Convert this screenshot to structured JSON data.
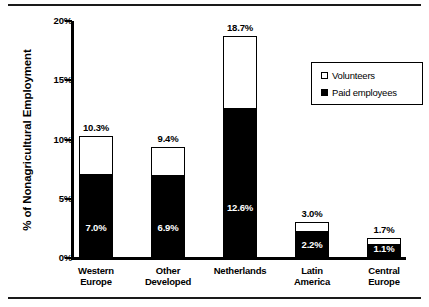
{
  "chart_data": {
    "type": "bar",
    "subtype": "stacked-bar",
    "title": "",
    "xlabel": "",
    "ylabel": "% of Nonagricultural Employment",
    "ylim": [
      0,
      20
    ],
    "yticks": [
      "0%",
      "5%",
      "10%",
      "15%",
      "20%"
    ],
    "ytick_values": [
      0,
      5,
      10,
      15,
      20
    ],
    "grid": false,
    "legend_position": "top-right",
    "categories": [
      "Western Europe",
      "Other Developed",
      "Netherlands",
      "Latin America",
      "Central Europe"
    ],
    "category_lines": [
      [
        "Western",
        "Europe"
      ],
      [
        "Other",
        "Developed"
      ],
      [
        "Netherlands",
        ""
      ],
      [
        "Latin",
        "America"
      ],
      [
        "Central",
        "Europe"
      ]
    ],
    "series": [
      {
        "name": "Paid employees",
        "color": "#000000",
        "values": [
          7.0,
          6.9,
          12.6,
          2.2,
          1.1
        ],
        "labels": [
          "7.0%",
          "6.9%",
          "12.6%",
          "2.2%",
          "1.1%"
        ]
      },
      {
        "name": "Volunteers",
        "color": "#ffffff",
        "values": [
          3.3,
          2.5,
          6.1,
          0.8,
          0.6
        ],
        "labels": [
          "",
          "",
          "",
          "",
          ""
        ]
      }
    ],
    "totals": [
      10.3,
      9.4,
      18.7,
      3.0,
      1.7
    ],
    "total_labels": [
      "10.3%",
      "9.4%",
      "18.7%",
      "3.0%",
      "1.7%"
    ]
  },
  "legend": {
    "items": [
      {
        "label": "Volunteers",
        "swatch": "hollow-square-icon"
      },
      {
        "label": "Paid employees",
        "swatch": "filled-square-icon"
      }
    ]
  }
}
